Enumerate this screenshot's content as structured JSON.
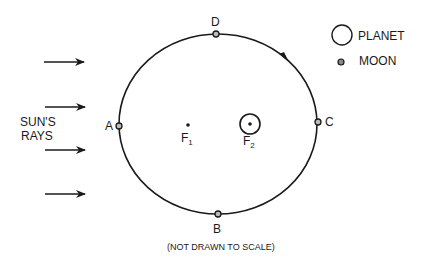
{
  "diagram": {
    "positions": [
      {
        "id": "A",
        "label": "A"
      },
      {
        "id": "B",
        "label": "B"
      },
      {
        "id": "C",
        "label": "C"
      },
      {
        "id": "D",
        "label": "D"
      }
    ],
    "foci": [
      {
        "label": "F",
        "subscript": "1"
      },
      {
        "label": "F",
        "subscript": "2"
      }
    ],
    "sun_rays_label_line1": "SUN'S",
    "sun_rays_label_line2": "RAYS",
    "sun_ray_count": 4,
    "legend": {
      "planet": "PLANET",
      "moon": "MOON"
    },
    "footnote": "(NOT DRAWN TO SCALE)",
    "orbit_direction": "counterclockwise"
  }
}
